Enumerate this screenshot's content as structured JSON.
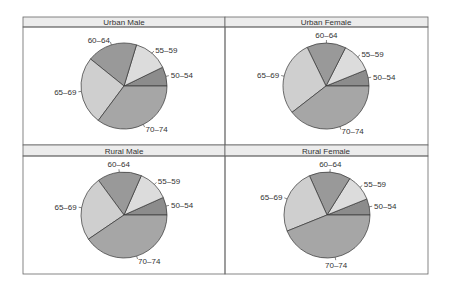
{
  "chart_data": [
    {
      "type": "pie",
      "title": "Urban Male",
      "categories": [
        "50–54",
        "55–59",
        "60–64",
        "65–69",
        "70–74"
      ],
      "values": [
        7.2,
        13.1,
        18.9,
        25.6,
        35.2
      ],
      "start_angle_deg": 0,
      "direction": "counterclockwise"
    },
    {
      "type": "pie",
      "title": "Urban Female",
      "categories": [
        "50–54",
        "55–59",
        "60–64",
        "65–69",
        "70–74"
      ],
      "values": [
        6.1,
        11.4,
        14.7,
        28.3,
        39.5
      ],
      "start_angle_deg": 0,
      "direction": "counterclockwise"
    },
    {
      "type": "pie",
      "title": "Rural Male",
      "categories": [
        "50–54",
        "55–59",
        "60–64",
        "65–69",
        "70–74"
      ],
      "values": [
        6.7,
        11.7,
        16.7,
        24.4,
        40.5
      ],
      "start_angle_deg": 0,
      "direction": "counterclockwise"
    },
    {
      "type": "pie",
      "title": "Rural Female",
      "categories": [
        "50–54",
        "55–59",
        "60–64",
        "65–69",
        "70–74"
      ],
      "values": [
        6.1,
        10.0,
        15.6,
        24.4,
        43.9
      ],
      "start_angle_deg": 0,
      "direction": "counterclockwise"
    }
  ],
  "colors": {
    "slices": [
      "#8c8c8c",
      "#dcdcdc",
      "#999999",
      "#cfcfcf",
      "#a6a6a6"
    ],
    "strip_bg": "#ececec",
    "border": "#666666",
    "slice_edge": "#333333"
  },
  "panels": [
    {
      "title": "Urban Male"
    },
    {
      "title": "Urban Female"
    },
    {
      "title": "Rural Male"
    },
    {
      "title": "Rural Female"
    }
  ]
}
